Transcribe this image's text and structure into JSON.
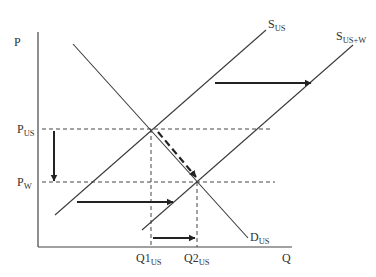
{
  "diagram": {
    "title": "",
    "axes": {
      "y_label": "P",
      "x_label": "Q"
    },
    "price_levels": [
      {
        "id": "p_us",
        "base": "P",
        "sub": "US"
      },
      {
        "id": "p_w",
        "base": "P",
        "sub": "W"
      }
    ],
    "quantity_levels": [
      {
        "id": "q1_us",
        "base": "Q1",
        "sub": "US"
      },
      {
        "id": "q2_us",
        "base": "Q2",
        "sub": "US"
      }
    ],
    "curves": [
      {
        "id": "s_us",
        "base": "S",
        "sub": "US",
        "kind": "supply"
      },
      {
        "id": "s_us_w",
        "base": "S",
        "sub": "US+W",
        "kind": "supply"
      },
      {
        "id": "d_us",
        "base": "D",
        "sub": "US",
        "kind": "demand"
      }
    ],
    "arrows": [
      {
        "id": "supply-shift-upper",
        "meaning": "supply shifts right from S_US to S_US+W"
      },
      {
        "id": "supply-shift-lower",
        "meaning": "supply shifts right from S_US to S_US+W"
      },
      {
        "id": "price-drop",
        "meaning": "price falls from P_US to P_W"
      },
      {
        "id": "quantity-increase",
        "meaning": "quantity rises from Q1_US to Q2_US"
      },
      {
        "id": "movement-along-demand",
        "meaning": "movement along D_US to new equilibrium"
      }
    ],
    "colors": {
      "line": "#3a3a3a",
      "arrow": "#222222",
      "background": "#ffffff"
    }
  }
}
